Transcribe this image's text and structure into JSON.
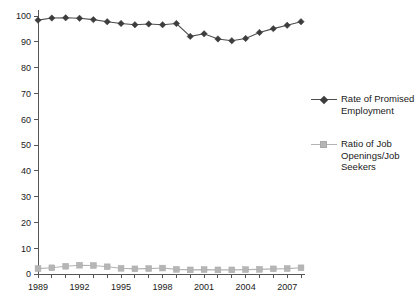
{
  "chart_data": {
    "type": "line",
    "title": "",
    "subtitle": "",
    "xlabel": "",
    "ylabel": "",
    "xlim": [
      1989,
      2008
    ],
    "ylim": [
      0,
      100
    ],
    "yticks": [
      0,
      10,
      20,
      30,
      40,
      50,
      60,
      70,
      80,
      90,
      100
    ],
    "ytick_labels": [
      "0",
      "10",
      "20",
      "30",
      "40",
      "50",
      "60",
      "70",
      "80",
      "90",
      "100"
    ],
    "x": [
      1989,
      1990,
      1991,
      1992,
      1993,
      1994,
      1995,
      1996,
      1997,
      1998,
      1999,
      2000,
      2001,
      2002,
      2003,
      2004,
      2005,
      2006,
      2007,
      2008
    ],
    "xtick_labels": [
      "1989",
      "",
      "",
      "1992",
      "",
      "",
      "1995",
      "",
      "",
      "1998",
      "",
      "",
      "2001",
      "",
      "",
      "2004",
      "",
      "",
      "2007",
      ""
    ],
    "xticks_labeled": [
      1989,
      1992,
      1995,
      1998,
      2001,
      2004,
      2007
    ],
    "grid": false,
    "legend_position": "right",
    "series": [
      {
        "name": "Rate of Promised Employment",
        "marker": "diamond",
        "color": "#3d3d3d",
        "values": [
          98.4,
          99.2,
          99.3,
          99.1,
          98.6,
          97.8,
          97.1,
          96.6,
          96.9,
          96.6,
          97.1,
          92.1,
          93.1,
          91.1,
          90.4,
          91.3,
          93.6,
          95.1,
          96.4,
          97.8
        ]
      },
      {
        "name": "Ratio of Job Openings/Job Seekers",
        "marker": "square",
        "color": "#b5b5b5",
        "values": [
          2.1,
          2.4,
          3.0,
          3.4,
          3.3,
          2.8,
          2.2,
          2.0,
          2.1,
          2.3,
          1.8,
          1.6,
          1.7,
          1.6,
          1.6,
          1.7,
          1.8,
          2.0,
          2.1,
          2.4
        ]
      }
    ]
  },
  "legend": {
    "entries": [
      {
        "label": "Rate of Promised Employment",
        "marker_name": "diamond-marker-dark"
      },
      {
        "label": "Ratio of Job Openings/Job Seekers",
        "marker_name": "square-marker-gray"
      }
    ]
  }
}
